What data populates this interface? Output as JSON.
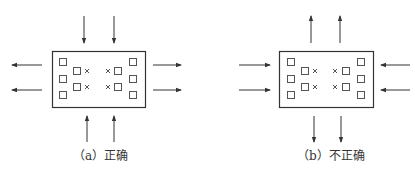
{
  "panels": [
    {
      "id": "a",
      "caption": "（a）正确",
      "box": {
        "x": 52,
        "y": 51,
        "w": 93,
        "h": 56
      },
      "vertical_arrows": "inward",
      "horizontal_arrows": "outward"
    },
    {
      "id": "b",
      "caption": "（b）不正确",
      "box": {
        "x": 279,
        "y": 51,
        "w": 94,
        "h": 56
      },
      "vertical_arrows": "outward",
      "horizontal_arrows": "inward"
    }
  ],
  "symbols": {
    "square": "□",
    "cross": "×"
  },
  "colors": {
    "line": "#333333",
    "text": "#333333"
  }
}
